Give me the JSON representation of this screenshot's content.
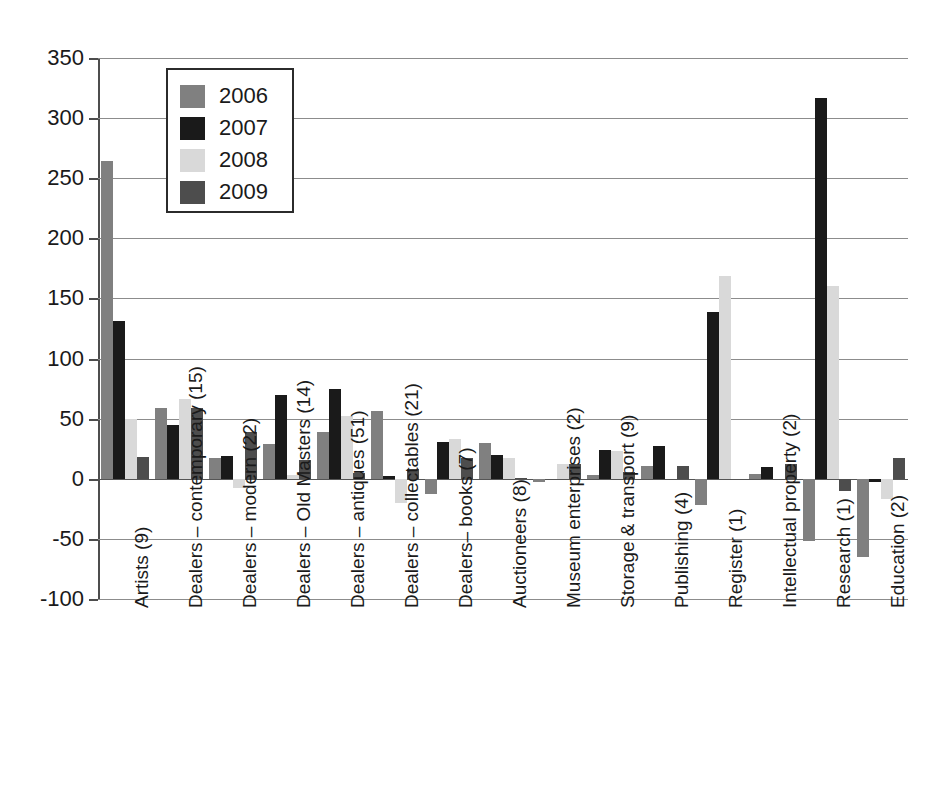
{
  "chart_data": {
    "type": "bar",
    "title": "",
    "subtitle": "",
    "xlabel": "",
    "ylabel": "",
    "ylim": [
      -100,
      350
    ],
    "ytick_step": 50,
    "yticks": [
      350,
      300,
      250,
      200,
      150,
      100,
      50,
      0,
      -50,
      -100
    ],
    "ytick_labels": [
      "350",
      "300",
      "250",
      "200",
      "150",
      "100",
      "50",
      "0",
      "-50",
      "-100"
    ],
    "grid": "horizontal",
    "legend_position": "upper-left-inside",
    "categories": [
      "Artists (9)",
      "Dealers – contemporary (15)",
      "Dealers – modern (22)",
      "Dealers – Old Masters (14)",
      "Dealers – antiques (51)",
      "Dealers – collectables (21)",
      "Dealers– books (7)",
      "Auctioneers (8)",
      "Museum enterprises (2)",
      "Storage & transport (9)",
      "Publishing (4)",
      "Register (1)",
      "Intellectual property (2)",
      "Research (1)",
      "Education (2)"
    ],
    "series": [
      {
        "name": "2006",
        "color": "#808080",
        "values": [
          264,
          59,
          17,
          29,
          39,
          56,
          -13,
          30,
          -3,
          3,
          11,
          -22,
          4,
          -52,
          -65
        ]
      },
      {
        "name": "2007",
        "color": "#1a1a1a",
        "values": [
          131,
          45,
          19,
          70,
          75,
          2,
          31,
          20,
          0,
          24,
          27,
          139,
          10,
          317,
          -3
        ]
      },
      {
        "name": "2008",
        "color": "#d9d9d9",
        "values": [
          50,
          66,
          -8,
          3,
          52,
          -20,
          33,
          17,
          12,
          23,
          0,
          169,
          0,
          160,
          -17
        ]
      },
      {
        "name": "2009",
        "color": "#4d4d4d",
        "values": [
          18,
          59,
          39,
          16,
          5,
          8,
          17,
          1,
          12,
          6,
          11,
          0,
          12,
          -10,
          17
        ]
      }
    ]
  },
  "legend": {
    "items": [
      {
        "label": "2006",
        "color": "#808080"
      },
      {
        "label": "2007",
        "color": "#1a1a1a"
      },
      {
        "label": "2008",
        "color": "#d9d9d9"
      },
      {
        "label": "2009",
        "color": "#4d4d4d"
      }
    ]
  }
}
